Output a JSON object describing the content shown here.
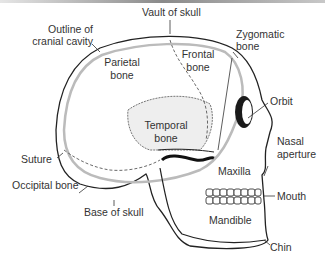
{
  "diagram": {
    "labels": {
      "vault": "Vault of skull",
      "outline_line1": "Outline  of",
      "outline_line2": "cranial cavity",
      "parietal_line1": "Parietal",
      "parietal_line2": "bone",
      "frontal_line1": "Frontal",
      "frontal_line2": "bone",
      "zygomatic_line1": "Zygomatic",
      "zygomatic_line2": "bone",
      "orbit": "Orbit",
      "temporal_line1": "Temporal",
      "temporal_line2": "bone",
      "nasal_line1": "Nasal",
      "nasal_line2": "aperture",
      "suture": "Suture",
      "maxilla": "Maxilla",
      "occipital": "Occipital bone",
      "mouth": "Mouth",
      "base": "Base of skull",
      "mandible": "Mandible",
      "chin": "Chin"
    },
    "colors": {
      "line": "#222222",
      "text": "#333333",
      "shade": "#d9d9d9"
    }
  }
}
